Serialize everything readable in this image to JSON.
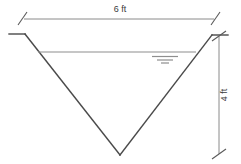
{
  "diagram": {
    "type": "v-notch-channel-cross-section",
    "background_color": "#ffffff",
    "line_color": "#4a4a4a",
    "dimension_color": "#8a8a8a",
    "water_color": "#8e8e8e",
    "top_width": {
      "label": "6 ft",
      "value": 6,
      "unit": "ft",
      "orientation": "horizontal"
    },
    "depth": {
      "label": "4 ft",
      "value": 4,
      "unit": "ft",
      "orientation": "vertical"
    },
    "water_surface": {
      "symbol": "water-surface-triangle-marks",
      "mark_count": 3
    },
    "geometry": {
      "left_top_x": 25,
      "right_top_x": 212,
      "top_y": 35,
      "apex_x": 120,
      "apex_y": 155,
      "water_y": 52,
      "water_left_x": 38,
      "water_right_x": 196,
      "dim_top_y": 19,
      "dim_right_x": 219
    }
  }
}
